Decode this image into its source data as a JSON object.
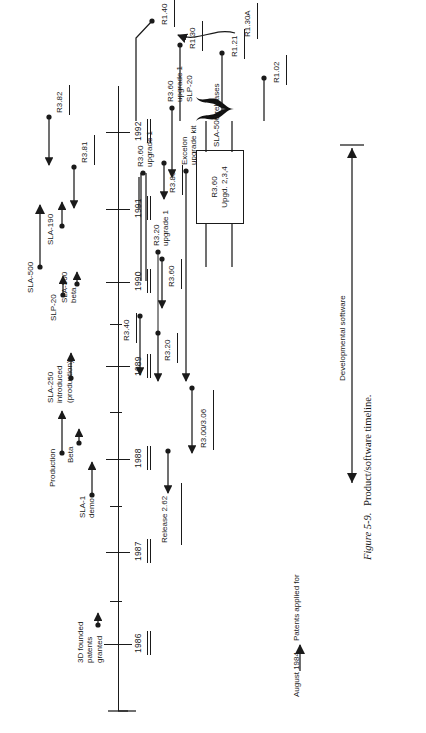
{
  "figure": {
    "caption_number": "Figure 5-9.",
    "caption_text": "Product/software timeline.",
    "title": "Product/software timeline"
  },
  "timeline": {
    "years": [
      "1986",
      "1987",
      "1988",
      "1989",
      "1990",
      "1991",
      "1992"
    ]
  },
  "hardware_events": [
    {
      "label": "3D founded\npatents\ngranted"
    },
    {
      "label": "SLA-1\ndemo"
    },
    {
      "label": "Beta"
    },
    {
      "label": "Production"
    },
    {
      "label": "SLA-250\nintroduced\n(production)"
    },
    {
      "label": "SLP-20"
    },
    {
      "label": "SLA-500\nbeta"
    },
    {
      "label": "SLA-500"
    },
    {
      "label": "SLA-190"
    }
  ],
  "software_releases": [
    {
      "label": "Release 2.62"
    },
    {
      "label": "R3.00/3.06"
    },
    {
      "label": "R3.20"
    },
    {
      "label": "R3.20\nupgrade 1"
    },
    {
      "label": "Excelon\nupgrade kit"
    },
    {
      "label": "R3.40"
    },
    {
      "label": "R3.60"
    },
    {
      "label": "R3.60\nupgrade 1"
    },
    {
      "label": "R3.60\nupgrade 1\nSLP-20"
    },
    {
      "label": "R3.80"
    },
    {
      "label": "R3.81"
    },
    {
      "label": "R3.82"
    },
    {
      "label": "R1.02"
    },
    {
      "label": "R1.21"
    },
    {
      "label": "R1.30"
    },
    {
      "label": "R1.30A"
    },
    {
      "label": "R1.40"
    }
  ],
  "callout_box": {
    "line1": "R3.60",
    "line2": "Upgd. 2,3,4"
  },
  "annotations": {
    "brace_label": "SLA-500 releases",
    "patents_date": "August 1984",
    "patents_text": "Patents applied for",
    "dev_software": "Developmental software"
  },
  "colors": {
    "ink": "#1a1a1a",
    "paper": "#ffffff"
  }
}
